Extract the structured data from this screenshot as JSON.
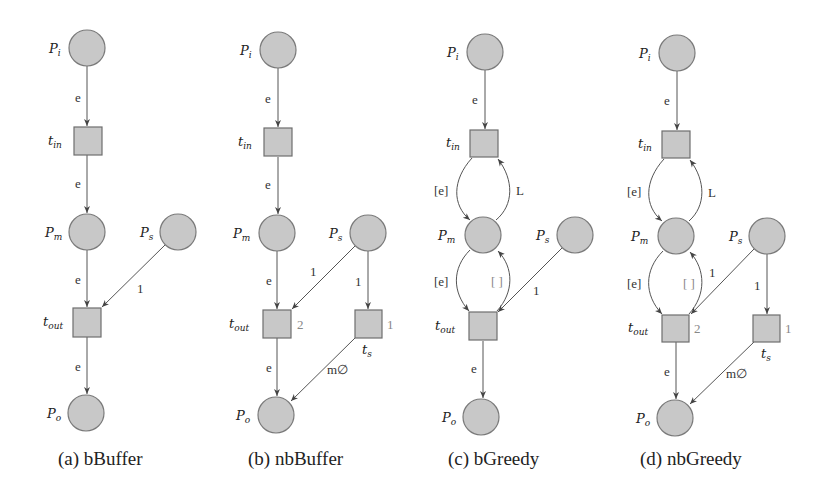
{
  "figure": {
    "subfigures": [
      {
        "id": "a",
        "caption": "(a) bBuffer",
        "places": {
          "Pi": "P",
          "Pi_sub": "i",
          "Pm": "P",
          "Pm_sub": "m",
          "Ps": "P",
          "Ps_sub": "s",
          "Po": "P",
          "Po_sub": "o"
        },
        "transitions": {
          "tin": "t",
          "tin_sub": "in",
          "tout": "t",
          "tout_sub": "out"
        },
        "arcs": {
          "pi_tin": "e",
          "tin_pm": "e",
          "pm_tout": "e",
          "ps_tout": "1",
          "tout_po": "e"
        }
      },
      {
        "id": "b",
        "caption": "(b) nbBuffer",
        "places": {
          "Pi": "P",
          "Pi_sub": "i",
          "Pm": "P",
          "Pm_sub": "m",
          "Ps": "P",
          "Ps_sub": "s",
          "Po": "P",
          "Po_sub": "o"
        },
        "transitions": {
          "tin": "t",
          "tin_sub": "in",
          "tout": "t",
          "tout_sub": "out",
          "ts": "t",
          "ts_sub": "s"
        },
        "priorities": {
          "tout": "2",
          "ts": "1"
        },
        "arcs": {
          "pi_tin": "e",
          "tin_pm": "e",
          "pm_tout": "e",
          "ps_tout": "1",
          "ps_ts": "1",
          "tout_po": "e",
          "ts_po": "m∅"
        }
      },
      {
        "id": "c",
        "caption": "(c) bGreedy",
        "places": {
          "Pi": "P",
          "Pi_sub": "i",
          "Pm": "P",
          "Pm_sub": "m",
          "Ps": "P",
          "Ps_sub": "s",
          "Po": "P",
          "Po_sub": "o"
        },
        "transitions": {
          "tin": "t",
          "tin_sub": "in",
          "tout": "t",
          "tout_sub": "out"
        },
        "arcs": {
          "pi_tin": "e",
          "tin_pm": "[e]",
          "pm_tin": "L",
          "pm_tout": "[e]",
          "tout_pm": "[ ]",
          "ps_tout": "1",
          "tout_po": "e"
        }
      },
      {
        "id": "d",
        "caption": "(d) nbGreedy",
        "places": {
          "Pi": "P",
          "Pi_sub": "i",
          "Pm": "P",
          "Pm_sub": "m",
          "Ps": "P",
          "Ps_sub": "s",
          "Po": "P",
          "Po_sub": "o"
        },
        "transitions": {
          "tin": "t",
          "tin_sub": "in",
          "tout": "t",
          "tout_sub": "out",
          "ts": "t",
          "ts_sub": "s"
        },
        "priorities": {
          "tout": "2",
          "ts": "1"
        },
        "arcs": {
          "pi_tin": "e",
          "tin_pm": "[e]",
          "pm_tin": "L",
          "pm_tout": "[e]",
          "tout_pm": "[ ]",
          "ps_tout": "1",
          "ps_ts": "1",
          "tout_po": "e",
          "ts_po": "m∅"
        }
      }
    ]
  }
}
